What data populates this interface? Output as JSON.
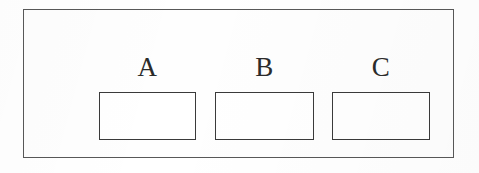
{
  "figure": {
    "title": "",
    "background_color": "#ffffff",
    "frame": {
      "name": "outer-frame",
      "border_color": "#585858",
      "fill_color": "#fefefe"
    },
    "boxes": [
      {
        "label": "A",
        "value": "",
        "border_color": "#3a3a3a",
        "fill_color": "#ffffff"
      },
      {
        "label": "B",
        "value": "",
        "border_color": "#3a3a3a",
        "fill_color": "#ffffff"
      },
      {
        "label": "C",
        "value": "",
        "border_color": "#3a3a3a",
        "fill_color": "#ffffff"
      }
    ]
  }
}
